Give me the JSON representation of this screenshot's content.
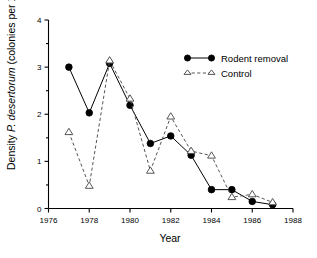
{
  "chart_data": {
    "type": "line",
    "title": "",
    "xlabel": "Year",
    "ylabel": "Density P. desertorum (colonies per 100 m2)",
    "ylabel_parts": {
      "prefix": "Density ",
      "italic": "P. desertorum",
      "suffix": " (colonies per 100 m",
      "superscript": "2",
      "close": ")"
    },
    "x": [
      1977,
      1978,
      1979,
      1980,
      1981,
      1982,
      1983,
      1984,
      1985,
      1986,
      1987
    ],
    "xlim": [
      1976,
      1988
    ],
    "ylim": [
      0,
      4
    ],
    "xticks": [
      1976,
      1978,
      1980,
      1982,
      1984,
      1986,
      1988
    ],
    "xtick_labels": [
      "1976",
      "1978",
      "1980",
      "1982",
      "1984",
      "1986",
      "1988"
    ],
    "yticks": [
      0,
      1,
      2,
      3,
      4
    ],
    "ytick_labels": [
      "0",
      "1",
      "2",
      "3",
      "4"
    ],
    "y_minor_ticks": [
      0.5,
      1.5,
      2.5,
      3.5
    ],
    "grid": false,
    "legend_position": "top-right",
    "series": [
      {
        "name": "Rodent removal",
        "marker": "filled-circle",
        "linestyle": "solid",
        "color": "#000000",
        "x": [
          1977,
          1978,
          1979,
          1980,
          1981,
          1982,
          1983,
          1984,
          1985,
          1986,
          1987
        ],
        "values": [
          3.0,
          2.03,
          3.08,
          2.19,
          1.38,
          1.54,
          1.13,
          0.4,
          0.4,
          0.15,
          0.08
        ]
      },
      {
        "name": "Control",
        "marker": "open-triangle",
        "linestyle": "dashed",
        "color": "#555555",
        "x": [
          1977,
          1978,
          1979,
          1980,
          1981,
          1982,
          1983,
          1984,
          1985,
          1986,
          1987
        ],
        "values": [
          1.62,
          0.48,
          3.14,
          2.33,
          0.8,
          1.95,
          1.22,
          1.12,
          0.24,
          0.3,
          0.13
        ]
      }
    ]
  },
  "legend": {
    "entries": [
      {
        "label": "Rodent removal"
      },
      {
        "label": "Control"
      }
    ]
  }
}
